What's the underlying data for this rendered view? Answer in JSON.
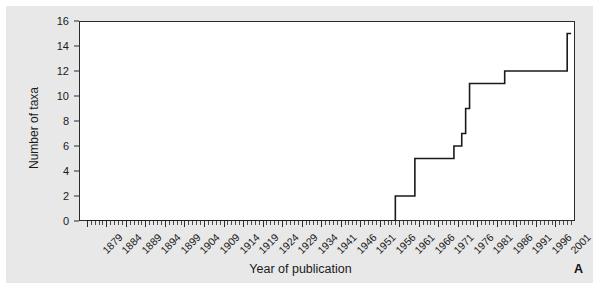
{
  "panel": {
    "label": "A"
  },
  "axes": {
    "x_title": "Year of publication",
    "y_title": "Number of taxa"
  },
  "chart_data": {
    "type": "line",
    "title": "",
    "subtitle": "",
    "xlabel": "Year of publication",
    "ylabel": "Number of taxa",
    "xlim": [
      1877,
      2004
    ],
    "ylim": [
      0,
      16
    ],
    "grid": false,
    "legend": null,
    "annotations": [
      "A"
    ],
    "x_tick_labels": [
      "1879",
      "1884",
      "1889",
      "1894",
      "1899",
      "1904",
      "1909",
      "1914",
      "1919",
      "1924",
      "1929",
      "1934",
      "1941",
      "1946",
      "1951",
      "1956",
      "1961",
      "1966",
      "1971",
      "1976",
      "1981",
      "1986",
      "1991",
      "1996",
      "2001"
    ],
    "x_tick_values": [
      1879,
      1884,
      1889,
      1894,
      1899,
      1904,
      1909,
      1914,
      1919,
      1924,
      1929,
      1934,
      1939,
      1944,
      1949,
      1954,
      1959,
      1964,
      1969,
      1974,
      1979,
      1984,
      1989,
      1994,
      1999
    ],
    "y_tick_labels": [
      "0",
      "2",
      "4",
      "6",
      "8",
      "10",
      "12",
      "14",
      "16"
    ],
    "y_tick_values": [
      0,
      2,
      4,
      6,
      8,
      10,
      12,
      14,
      16
    ],
    "series": [
      {
        "name": "Cumulative number of taxa",
        "step": "post",
        "x": [
          1879,
          1957,
          1958,
          1962,
          1963,
          1971,
          1973,
          1975,
          1976,
          1977,
          1985,
          1986,
          2000,
          2002,
          2003
        ],
        "y": [
          0,
          0,
          2,
          2,
          5,
          5,
          6,
          7,
          9,
          11,
          11,
          12,
          12,
          15,
          15
        ]
      }
    ]
  }
}
